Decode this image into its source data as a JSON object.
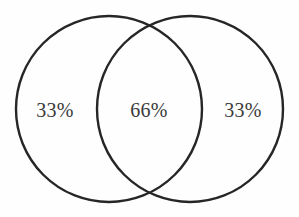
{
  "figure": {
    "type": "venn-diagram",
    "background_color": "#fefefe",
    "stroke_color": "#262626",
    "text_color": "#3a3a3a"
  },
  "chart_data": {
    "type": "pie",
    "title": "",
    "subtitle": "",
    "xlabel": "",
    "ylabel": "",
    "categories": [
      "Left only",
      "Overlap",
      "Right only"
    ],
    "values": [
      33,
      66,
      33
    ],
    "labels": [
      "33%",
      "66%",
      "33%"
    ],
    "legend": [],
    "annotations": [],
    "grid": false,
    "sets": [
      {
        "name": "left-circle",
        "cx": 109,
        "cy": 109,
        "r": 93,
        "label": "33%"
      },
      {
        "name": "right-circle",
        "cx": 190,
        "cy": 109,
        "r": 93,
        "label": "33%"
      }
    ],
    "intersection": {
      "name": "overlap-region",
      "label": "66%"
    }
  },
  "labels": {
    "left": "33%",
    "center": "66%",
    "right": "33%"
  }
}
